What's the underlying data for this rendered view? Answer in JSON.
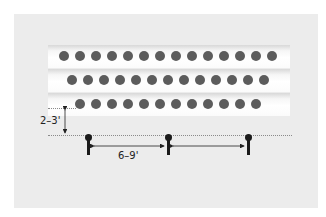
{
  "diagram": {
    "rows": [
      {
        "name": "row-1",
        "plant_count": 14
      },
      {
        "name": "row-2",
        "plant_count": 13
      },
      {
        "name": "row-3",
        "plant_count": 12
      }
    ],
    "post_count": 3,
    "row_to_post_distance_label": "2–3'",
    "post_spacing_label": "6–9'",
    "colors": {
      "background": "#ececec",
      "plant": "#5c5c5c",
      "post": "#1a1a1a",
      "guide_line": "#8a8a8a"
    }
  }
}
